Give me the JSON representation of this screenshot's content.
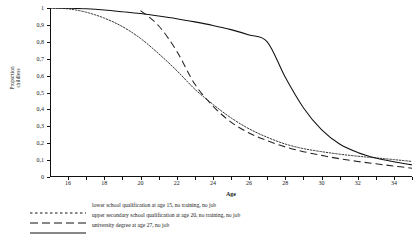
{
  "chart_data": {
    "type": "line",
    "title": "",
    "xlabel": "Age",
    "ylabel_line1": "Proportion",
    "ylabel_line2": "childless",
    "xlim": [
      15,
      35
    ],
    "ylim": [
      0,
      1
    ],
    "grid": false,
    "legend_position": "below-axis-left",
    "xticks": [
      "16",
      "18",
      "20",
      "22",
      "24",
      "26",
      "28",
      "30",
      "32",
      "34"
    ],
    "xtick_values": [
      16,
      18,
      20,
      22,
      24,
      26,
      28,
      30,
      32,
      34
    ],
    "yticks": [
      "0",
      "0,1",
      "0,2",
      "0,3",
      "0,4",
      "0,5",
      "0,6",
      "0,7",
      "0,8",
      "0,9",
      "1"
    ],
    "ytick_values": [
      0,
      0.1,
      0.2,
      0.3,
      0.4,
      0.5,
      0.6,
      0.7,
      0.8,
      0.9,
      1
    ],
    "x": [
      15,
      16,
      17,
      18,
      19,
      20,
      21,
      22,
      23,
      24,
      25,
      26,
      27,
      28,
      29,
      30,
      31,
      32,
      33,
      34,
      35
    ],
    "series": [
      {
        "name": "lower school qualification at age 15, no training, no job",
        "style": "dotted",
        "color": "#333333",
        "values": [
          1.0,
          0.995,
          0.975,
          0.94,
          0.89,
          0.82,
          0.73,
          0.63,
          0.52,
          0.43,
          0.35,
          0.285,
          0.235,
          0.195,
          0.168,
          0.15,
          0.135,
          0.123,
          0.113,
          0.103,
          0.092
        ]
      },
      {
        "name": "upper secondary school qualification at age 20, no training, no job",
        "style": "dashed",
        "color": "#222222",
        "values": [
          null,
          null,
          null,
          null,
          null,
          0.985,
          0.895,
          0.745,
          0.55,
          0.42,
          0.325,
          0.26,
          0.215,
          0.178,
          0.15,
          0.128,
          0.108,
          0.092,
          0.078,
          0.065,
          0.052
        ]
      },
      {
        "name": "university degree at age 27, no job",
        "style": "solid",
        "color": "#111111",
        "values": [
          1.0,
          0.999,
          0.995,
          0.988,
          0.978,
          0.967,
          0.953,
          0.937,
          0.918,
          0.897,
          0.872,
          0.84,
          0.8,
          0.59,
          0.41,
          0.28,
          0.195,
          0.145,
          0.112,
          0.09,
          0.072
        ]
      }
    ]
  },
  "legend": {
    "items": [
      {
        "label": "lower school qualification at age 15, no training, no job",
        "style": "dotted"
      },
      {
        "label": "upper secondary school qualification at age 20, no training, no job",
        "style": "dashed"
      },
      {
        "label": "university degree at age 27, no job",
        "style": "solid"
      }
    ]
  }
}
